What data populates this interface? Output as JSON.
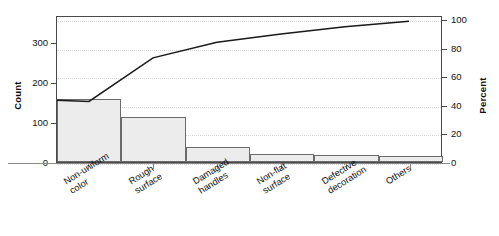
{
  "chart_data": {
    "type": "bar",
    "title": "",
    "subtitle": "",
    "xlabel": "",
    "ylabel": "Count",
    "ylabel_secondary": "Percent",
    "categories": [
      "Non-uniform color",
      "Rough surface",
      "Damaged handles",
      "Non-flat surface",
      "Defective decoration",
      "Others"
    ],
    "category_lines": [
      [
        "Non-uniform",
        "color"
      ],
      [
        "Rough",
        "surface"
      ],
      [
        "Damaged",
        "handles"
      ],
      [
        "Non-flat",
        "surface"
      ],
      [
        "Defective",
        "decoration"
      ],
      [
        "Others"
      ]
    ],
    "values": [
      156,
      113,
      38,
      21,
      18,
      16
    ],
    "cumulative_percent": [
      43,
      74,
      85,
      91,
      96,
      100
    ],
    "ylim": [
      0,
      366
    ],
    "ylim_secondary": [
      0,
      103
    ],
    "yticks": [
      0,
      100,
      200,
      300
    ],
    "yticks_secondary": [
      0,
      20,
      40,
      60,
      80,
      100
    ],
    "grid": true,
    "legend": "none",
    "series": [
      {
        "name": "Count",
        "type": "bar",
        "values": [
          156,
          113,
          38,
          21,
          18,
          16
        ]
      },
      {
        "name": "Cumulative Percent",
        "type": "line",
        "values": [
          43,
          74,
          85,
          91,
          96,
          100
        ]
      }
    ],
    "colors": {
      "bar_fill": "#ececec",
      "bar_stroke": "#6b6b6b",
      "line": "#1a1a1a",
      "frame": "#4a4a4a",
      "grid": "#d8d8d8",
      "text": "#111111"
    }
  }
}
